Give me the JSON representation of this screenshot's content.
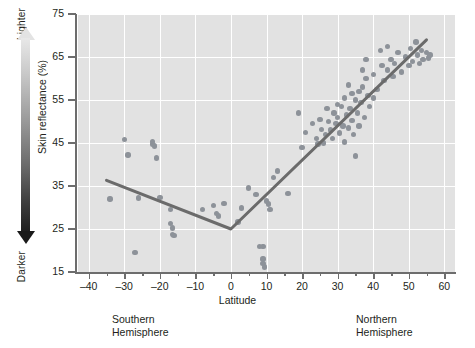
{
  "axis_arrow": {
    "top_label": "Lighter",
    "bottom_label": "Darker"
  },
  "labels": {
    "ylabel": "Skin reflectance (%)",
    "xlabel": "Latitude",
    "hemisphere_left": "Southern\nHemisphere",
    "hemisphere_left_line1": "Southern",
    "hemisphere_left_line2": "Hemisphere",
    "hemisphere_right_line1": "Northern",
    "hemisphere_right_line2": "Hemisphere"
  },
  "colors": {
    "plot_background": "#e2e2e2",
    "gridline": "#ffffff",
    "point": "#8d9299",
    "trend_line": "#6b6b6b",
    "axis": "#6d6d6d",
    "text": "#231f20"
  },
  "chart_data": {
    "type": "scatter",
    "title": "",
    "xlabel": "Latitude",
    "ylabel": "Skin reflectance (%)",
    "xlim": [
      -43,
      63
    ],
    "ylim": [
      15,
      75
    ],
    "xticks": [
      -40,
      -30,
      -20,
      -10,
      0,
      10,
      20,
      30,
      40,
      50,
      60
    ],
    "yticks": [
      15,
      25,
      35,
      45,
      55,
      65,
      75
    ],
    "xtick_minor_step": 5,
    "grid": "white gridlines on gray panel, horizontal at each y tick and vertical at each x tick",
    "legend": "none",
    "annotations": [
      "Southern Hemisphere (left of 0)",
      "Northern Hemisphere (right of 0)",
      "Gradient arrow at left: Lighter (top) to Darker (bottom)"
    ],
    "points": [
      [
        -34,
        32.0
      ],
      [
        -30,
        45.8
      ],
      [
        -29,
        42.2
      ],
      [
        -27,
        19.5
      ],
      [
        -26,
        32.2
      ],
      [
        -22,
        44.8
      ],
      [
        -22,
        45.3
      ],
      [
        -21.5,
        44.3
      ],
      [
        -21,
        41.5
      ],
      [
        -20,
        32.3
      ],
      [
        -17,
        29.5
      ],
      [
        -17,
        26.3
      ],
      [
        -16.5,
        25.2
      ],
      [
        -16.5,
        23.8
      ],
      [
        -16,
        23.5
      ],
      [
        -8,
        29.5
      ],
      [
        -5,
        30.5
      ],
      [
        -4,
        28.6
      ],
      [
        -3.5,
        28.0
      ],
      [
        -2,
        31.0
      ],
      [
        2,
        26.6
      ],
      [
        3,
        29.9
      ],
      [
        5,
        34.5
      ],
      [
        7,
        33.0
      ],
      [
        8,
        21.0
      ],
      [
        9,
        21.0
      ],
      [
        9,
        18.0
      ],
      [
        9,
        17.0
      ],
      [
        9.5,
        16.2
      ],
      [
        10,
        31.5
      ],
      [
        10.5,
        30.8
      ],
      [
        11,
        29.6
      ],
      [
        12,
        37.0
      ],
      [
        13,
        38.5
      ],
      [
        16,
        33.3
      ],
      [
        19,
        52.0
      ],
      [
        20,
        44.0
      ],
      [
        21,
        47.5
      ],
      [
        23,
        49.5
      ],
      [
        24,
        46.0
      ],
      [
        24.5,
        44.8
      ],
      [
        25,
        50.5
      ],
      [
        25.5,
        48.2
      ],
      [
        26,
        45.0
      ],
      [
        26.5,
        47.0
      ],
      [
        27,
        53.0
      ],
      [
        27.5,
        50.0
      ],
      [
        28,
        48.0
      ],
      [
        28.5,
        46.0
      ],
      [
        29,
        52.0
      ],
      [
        29.5,
        49.5
      ],
      [
        30,
        54.0
      ],
      [
        30,
        51.0
      ],
      [
        30.5,
        47.3
      ],
      [
        31,
        53.5
      ],
      [
        31.5,
        49.0
      ],
      [
        32,
        55.5
      ],
      [
        32,
        45.2
      ],
      [
        32.5,
        51.5
      ],
      [
        33,
        58.5
      ],
      [
        33,
        48.5
      ],
      [
        33.5,
        53.0
      ],
      [
        34,
        56.5
      ],
      [
        34,
        50.2
      ],
      [
        34.5,
        47.0
      ],
      [
        35,
        55.0
      ],
      [
        35,
        42.0
      ],
      [
        35.5,
        52.0
      ],
      [
        36,
        57.0
      ],
      [
        36,
        49.0
      ],
      [
        36.5,
        54.5
      ],
      [
        37,
        62.0
      ],
      [
        37,
        58.0
      ],
      [
        37.5,
        51.0
      ],
      [
        38,
        64.5
      ],
      [
        38,
        60.0
      ],
      [
        38.5,
        56.0
      ],
      [
        39,
        53.5
      ],
      [
        40,
        61.0
      ],
      [
        40,
        55.5
      ],
      [
        41,
        57.5
      ],
      [
        42,
        66.5
      ],
      [
        42.5,
        63.0
      ],
      [
        43,
        59.5
      ],
      [
        44,
        67.5
      ],
      [
        44,
        62.0
      ],
      [
        45,
        64.5
      ],
      [
        45.5,
        60.5
      ],
      [
        46,
        63.5
      ],
      [
        47,
        66.0
      ],
      [
        48,
        61.5
      ],
      [
        49,
        65.0
      ],
      [
        50,
        63.0
      ],
      [
        50.5,
        67.0
      ],
      [
        51,
        64.0
      ],
      [
        52,
        68.5
      ],
      [
        52.5,
        65.5
      ],
      [
        53,
        63.5
      ],
      [
        53.5,
        66.5
      ],
      [
        54,
        64.5
      ],
      [
        55,
        66.0
      ],
      [
        55.5,
        64.8
      ],
      [
        56,
        65.5
      ]
    ],
    "trend_line": {
      "kind": "piecewise-linear",
      "segments": [
        {
          "from": [
            -35,
            36.3
          ],
          "to": [
            0,
            25.0
          ]
        },
        {
          "from": [
            0,
            25.0
          ],
          "to": [
            55,
            69.0
          ]
        }
      ],
      "elbow": [
        0,
        25.0
      ]
    }
  }
}
